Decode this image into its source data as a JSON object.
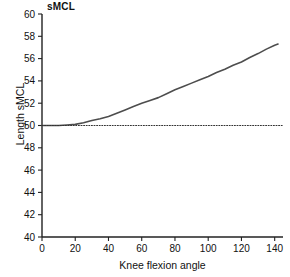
{
  "chart_data": {
    "type": "line",
    "title": "sMCL",
    "xlabel": "Knee flexion angle",
    "ylabel": "Length sMCL",
    "xlim": [
      0,
      145
    ],
    "ylim": [
      40,
      60
    ],
    "xticks": [
      0,
      20,
      40,
      60,
      80,
      100,
      120,
      140
    ],
    "yticks": [
      40,
      42,
      44,
      46,
      48,
      50,
      52,
      54,
      56,
      58,
      60
    ],
    "grid": false,
    "legend": null,
    "series": [
      {
        "name": "sMCL length",
        "style": "solid",
        "color": "#4d4d4d",
        "x": [
          0,
          5,
          10,
          15,
          20,
          25,
          30,
          35,
          40,
          45,
          50,
          55,
          60,
          65,
          70,
          75,
          80,
          85,
          90,
          95,
          100,
          105,
          110,
          115,
          120,
          125,
          130,
          135,
          140,
          142
        ],
        "y": [
          50.0,
          50.0,
          50.0,
          50.05,
          50.1,
          50.25,
          50.45,
          50.6,
          50.8,
          51.1,
          51.4,
          51.7,
          52.0,
          52.25,
          52.5,
          52.85,
          53.2,
          53.5,
          53.8,
          54.1,
          54.4,
          54.75,
          55.05,
          55.4,
          55.7,
          56.1,
          56.45,
          56.85,
          57.2,
          57.3
        ]
      },
      {
        "name": "reference line",
        "style": "dotted",
        "color": "#333333",
        "x": [
          0,
          145
        ],
        "y": [
          50.0,
          50.0
        ]
      }
    ]
  }
}
